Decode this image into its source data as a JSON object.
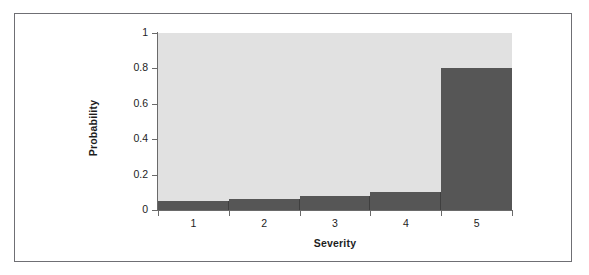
{
  "figure": {
    "border_color": "#6f6f74",
    "background_color": "#ffffff"
  },
  "chart_data": {
    "type": "bar",
    "title": "",
    "subtitle": "",
    "xlabel": "Severity",
    "ylabel": "Probability",
    "categories": [
      "1",
      "2",
      "3",
      "4",
      "5"
    ],
    "values": [
      0.05,
      0.06,
      0.08,
      0.1,
      0.8
    ],
    "series": [
      {
        "name": "Probability",
        "values": [
          0.05,
          0.06,
          0.08,
          0.1,
          0.8
        ]
      }
    ],
    "ylim": [
      0,
      1
    ],
    "yticks": [
      "0",
      "0.2",
      "0.4",
      "0.6",
      "0.8",
      "1"
    ],
    "ytick_values": [
      0,
      0.2,
      0.4,
      0.6,
      0.8,
      1
    ],
    "xticks": [
      "1",
      "2",
      "3",
      "4",
      "5"
    ],
    "grid": false,
    "legend": null,
    "legend_position": "none",
    "bar_color": "#565656",
    "plot_background_color": "#e1e1e1",
    "axis_color": "#6a6a6a",
    "annotations": []
  }
}
